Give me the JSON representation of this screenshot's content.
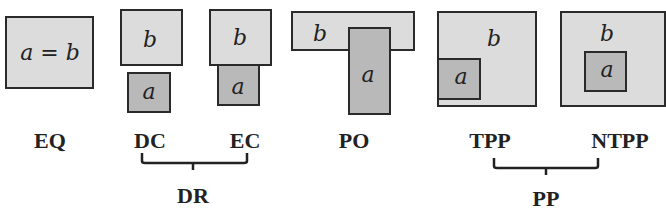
{
  "diagram": {
    "type": "RCC8 region connection calculus relations",
    "colors": {
      "region_b_fill": "#dcdcdc",
      "region_a_fill": "#b9b9b9",
      "border": "#2a2a2a",
      "text": "#222222"
    },
    "panels": [
      {
        "id": "EQ",
        "label": "EQ",
        "region_texts": [
          "a = b"
        ]
      },
      {
        "id": "DC",
        "label": "DC",
        "region_texts": [
          "b",
          "a"
        ]
      },
      {
        "id": "EC",
        "label": "EC",
        "region_texts": [
          "b",
          "a"
        ]
      },
      {
        "id": "PO",
        "label": "PO",
        "region_texts": [
          "b",
          "a"
        ]
      },
      {
        "id": "TPP",
        "label": "TPP",
        "region_texts": [
          "b",
          "a"
        ]
      },
      {
        "id": "NTPP",
        "label": "NTPP",
        "region_texts": [
          "b",
          "a"
        ]
      }
    ],
    "groups": [
      {
        "label": "DR",
        "members": [
          "DC",
          "EC"
        ]
      },
      {
        "label": "PP",
        "members": [
          "TPP",
          "NTPP"
        ]
      }
    ]
  }
}
